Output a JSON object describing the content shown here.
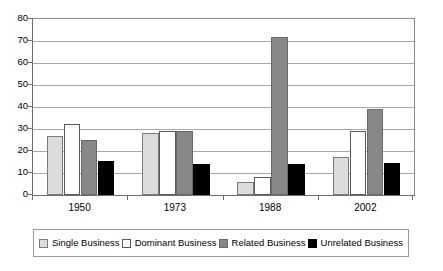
{
  "chart_data": {
    "type": "bar",
    "title": "",
    "subtitle": "",
    "xlabel": "",
    "ylabel": "",
    "categories": [
      "1950",
      "1973",
      "1988",
      "2002"
    ],
    "series": [
      {
        "name": "Single Business",
        "color": "#dcdcdc",
        "values": [
          27,
          28,
          6,
          17.5
        ]
      },
      {
        "name": "Dominant Business",
        "color": "#ffffff",
        "values": [
          32.5,
          29,
          8,
          29
        ]
      },
      {
        "name": "Related Business",
        "color": "#878787",
        "values": [
          25,
          29,
          72,
          39
        ]
      },
      {
        "name": "Unrelated Business",
        "color": "#000000",
        "values": [
          15.5,
          14,
          14,
          14.5
        ]
      }
    ],
    "ylim": [
      0,
      80
    ],
    "ytick_step": 10,
    "yticks": [
      "0",
      "10",
      "20",
      "30",
      "40",
      "50",
      "60",
      "70",
      "80"
    ],
    "grid": true,
    "legend_position": "bottom"
  },
  "legend": {
    "items": [
      {
        "label": "Single Business"
      },
      {
        "label": "Dominant Business"
      },
      {
        "label": "Related Business"
      },
      {
        "label": "Unrelated Business"
      }
    ]
  },
  "colors": {
    "single": "#dcdcdc",
    "dominant": "#ffffff",
    "related": "#878787",
    "unrelated": "#000000",
    "gridline": "#a9a9a9",
    "axis": "#6f6f6f",
    "legend_border": "#9a9a9a",
    "background": "#ffffff"
  }
}
